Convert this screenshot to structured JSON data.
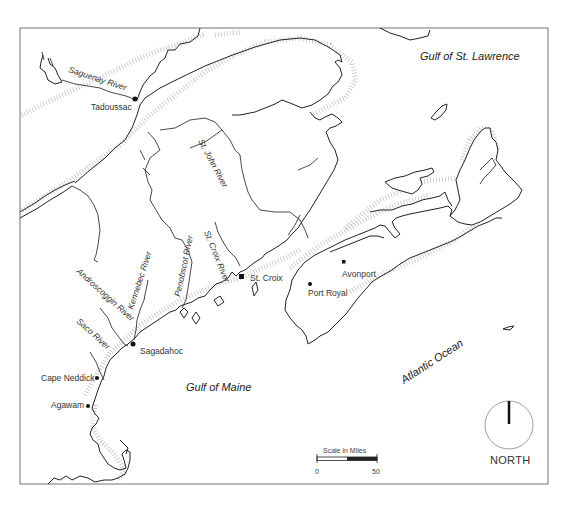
{
  "map": {
    "water_bodies": {
      "gulf_st_lawrence": "Gulf of St. Lawrence",
      "gulf_of_maine": "Gulf of Maine",
      "atlantic_ocean": "Atlantic Ocean"
    },
    "rivers": {
      "saguenay": "Saguenay River",
      "st_john": "St. John River",
      "st_croix": "St. Croix River",
      "penobscot": "Penobscot River",
      "kennebec": "Kennebec River",
      "androscoggin": "Androscoggin River",
      "saco": "Saco River"
    },
    "settlements": {
      "tadoussac": "Tadoussac",
      "st_croix": "St. Croix",
      "avonport": "Avonport",
      "port_royal": "Port Royal",
      "sagadahoc": "Sagadahoc",
      "cape_neddick": "Cape Neddick",
      "agawam": "Agawam"
    },
    "scale": {
      "title": "Scale in Miles",
      "min_label": "0",
      "max_label": "50"
    },
    "compass": {
      "label": "NORTH"
    }
  }
}
